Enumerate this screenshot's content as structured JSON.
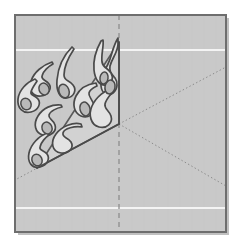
{
  "figure": {
    "title": "Kirigami fold-and-cut pattern",
    "canvas": {
      "width": 238,
      "height": 244
    }
  },
  "colors": {
    "page_background": "#ffffff",
    "paper_fill": "#c9c9c9",
    "paper_border": "#6e6e6e",
    "paper_shadow": "#8d8d8d",
    "motif_fill": "#e3e3e3",
    "motif_stroke": "#4a4a4a",
    "accent_dot_fill": "#b9b9b9",
    "crease_dashed": "#8e8e8e",
    "crease_dotted": "#8a8a8a",
    "highlight_line": "#f4f4f4",
    "sector_edge": "#5a5a5a"
  },
  "paper": {
    "label": "paper-sheet",
    "x": 15,
    "y": 15,
    "width": 211,
    "height": 217,
    "border_width": 2
  },
  "center_point": {
    "x": 119,
    "y": 124
  },
  "creases": [
    {
      "name": "vertical-fold",
      "style": "dashed",
      "x1": 119,
      "y1": 15,
      "x2": 119,
      "y2": 232
    },
    {
      "name": "diagonal-fold-upper-right",
      "style": "dotted",
      "x1": 119,
      "y1": 124,
      "x2": 226,
      "y2": 67
    },
    {
      "name": "diagonal-fold-lower-right",
      "style": "dotted",
      "x1": 119,
      "y1": 124,
      "x2": 226,
      "y2": 186
    },
    {
      "name": "diagonal-fold-lower-left",
      "style": "dotted",
      "x1": 119,
      "y1": 124,
      "x2": 15,
      "y2": 180
    }
  ],
  "highlight_lines": [
    {
      "name": "highlight-line-top",
      "y": 50
    },
    {
      "name": "highlight-line-bottom",
      "y": 208
    }
  ],
  "sector": {
    "name": "cut-sector",
    "points": "119,42 119,124 37,168",
    "apex": {
      "x": 119,
      "y": 124
    },
    "top": {
      "x": 119,
      "y": 42
    },
    "left": {
      "x": 37,
      "y": 168
    }
  },
  "motif": {
    "name": "flame-leaf-motif",
    "element_count": 6,
    "paths": [
      "M118,38 C112,48 112,56 108,64 C104,72 100,78 101,86 C102,94 108,97 113,93 C118,89 118,82 115,78 C112,74 109,72 110,66 C112,58 118,52 118,44 Z",
      "M101,41 C96,50 93,60 94,70 C95,80 100,86 106,85 C112,84 114,78 111,73 C108,68 103,68 102,62 C101,54 104,46 103,40 Z",
      "M96,83 C88,84 80,88 76,96 C72,104 74,113 81,116 C88,119 95,114 94,106 C93,99 88,97 89,93 C90,89 95,87 97,86 Z",
      "M113,88 C105,90 96,97 92,106 C88,115 91,125 99,127 C107,129 113,123 111,116 C109,110 104,109 105,104 C106,99 112,93 114,90 Z",
      "M72,47 C63,56 58,68 57,80 C56,91 60,99 67,98 C74,97 77,90 73,85 C69,80 64,81 64,75 C64,66 70,55 74,49 Z",
      "M52,62 C43,65 34,72 31,81 C28,90 33,97 41,96 C49,95 52,88 49,84 C46,80 41,80 42,76 C43,71 49,66 53,64 Z",
      "M35,79 C27,82 19,90 18,99 C17,108 23,114 31,112 C39,110 41,103 38,99 C35,95 30,96 31,92 C32,88 36,83 37,81 Z",
      "M61,105 C52,104 43,108 38,116 C33,124 35,133 43,135 C51,137 57,131 55,125 C53,119 48,119 49,115 C50,111 57,108 62,107 Z",
      "M47,133 C39,136 31,144 29,153 C27,162 32,169 40,167 C48,165 50,158 47,154 C44,150 39,151 40,147 C41,142 46,137 49,135 Z",
      "M81,124 C73,122 62,126 56,134 C50,142 52,152 61,153 C70,154 74,147 71,142 C68,137 62,138 63,133 C64,128 75,126 82,127 Z"
    ],
    "dots": [
      {
        "cx": 110,
        "cy": 87,
        "rx": 5,
        "ry": 7,
        "rot": 12
      },
      {
        "cx": 104,
        "cy": 78,
        "rx": 4,
        "ry": 6,
        "rot": 8
      },
      {
        "cx": 85,
        "cy": 109,
        "rx": 5,
        "ry": 7,
        "rot": -15
      },
      {
        "cx": 64,
        "cy": 91,
        "rx": 5,
        "ry": 7,
        "rot": -20
      },
      {
        "cx": 44,
        "cy": 89,
        "rx": 5,
        "ry": 6,
        "rot": -20
      },
      {
        "cx": 26,
        "cy": 104,
        "rx": 5,
        "ry": 6,
        "rot": -25
      },
      {
        "cx": 47,
        "cy": 128,
        "rx": 5,
        "ry": 6,
        "rot": -20
      },
      {
        "cx": 37,
        "cy": 160,
        "rx": 5,
        "ry": 6,
        "rot": -25
      }
    ]
  },
  "legend": {
    "dashed_label": "valley fold",
    "dotted_label": "fold guide",
    "solid_label": "cut edge"
  }
}
